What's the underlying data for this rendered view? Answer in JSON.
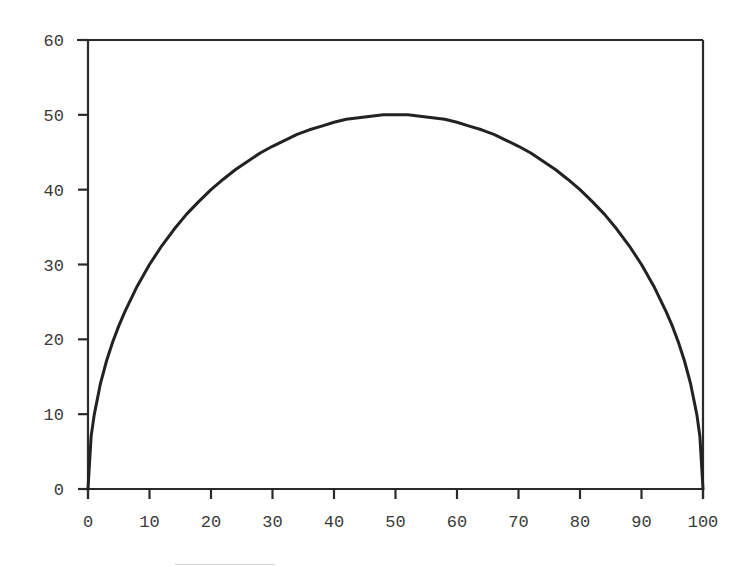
{
  "chart_data": {
    "type": "line",
    "title": "",
    "xlabel": "",
    "ylabel": "",
    "xlim": [
      0,
      100
    ],
    "ylim": [
      0,
      60
    ],
    "grid": false,
    "legend": null,
    "x_ticks": [
      "0",
      "10",
      "20",
      "30",
      "40",
      "50",
      "60",
      "70",
      "80",
      "90",
      "100"
    ],
    "y_ticks": [
      "0",
      "10",
      "20",
      "30",
      "40",
      "50",
      "60"
    ],
    "series": [
      {
        "name": "semicircle",
        "color": "#222222",
        "x": [
          0,
          0.5,
          1,
          2,
          3,
          4,
          5,
          6,
          8,
          10,
          12,
          14,
          16,
          18,
          20,
          22,
          24,
          26,
          28,
          30,
          32,
          34,
          36,
          38,
          40,
          42,
          44,
          46,
          48,
          50,
          52,
          54,
          56,
          58,
          60,
          62,
          64,
          66,
          68,
          70,
          72,
          74,
          76,
          78,
          80,
          82,
          84,
          86,
          88,
          90,
          92,
          94,
          95,
          96,
          97,
          98,
          99,
          99.5,
          100
        ],
        "y": [
          0,
          7.0,
          9.9,
          14.0,
          17.1,
          19.6,
          21.8,
          23.7,
          27.1,
          30.0,
          32.5,
          34.7,
          36.7,
          38.4,
          40.0,
          41.4,
          42.7,
          43.8,
          44.9,
          45.8,
          46.6,
          47.4,
          48.0,
          48.5,
          49.0,
          49.4,
          49.6,
          49.8,
          50.0,
          50.0,
          50.0,
          49.8,
          49.6,
          49.4,
          49.0,
          48.5,
          48.0,
          47.4,
          46.6,
          45.8,
          44.9,
          43.8,
          42.7,
          41.4,
          40.0,
          38.4,
          36.7,
          34.7,
          32.5,
          30.0,
          27.1,
          23.7,
          21.8,
          19.6,
          17.1,
          14.0,
          9.9,
          7.0,
          0
        ]
      }
    ]
  },
  "footer": {
    "line_color": "#d4d4d4"
  }
}
